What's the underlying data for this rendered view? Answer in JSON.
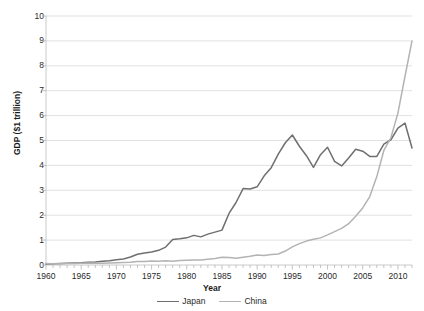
{
  "chart_data": {
    "type": "line",
    "title": "",
    "xlabel": "Year",
    "ylabel": "GDP ($1 trillion)",
    "xlim": [
      1960,
      2012
    ],
    "ylim": [
      0,
      10
    ],
    "ytick_labels": [
      "0",
      "1",
      "2",
      "3",
      "4",
      "5",
      "6",
      "7",
      "8",
      "9",
      "10"
    ],
    "ytick_values": [
      0,
      1,
      2,
      3,
      4,
      5,
      6,
      7,
      8,
      9,
      10
    ],
    "xtick_labels": [
      "1960",
      "1965",
      "1970",
      "1975",
      "1980",
      "1985",
      "1990",
      "1995",
      "2000",
      "2005",
      "2010"
    ],
    "xtick_values": [
      1960,
      1965,
      1970,
      1975,
      1980,
      1985,
      1990,
      1995,
      2000,
      2005,
      2010
    ],
    "minor_xticks_every": 1,
    "grid": "horizontal",
    "legend_position": "bottom",
    "x": [
      1960,
      1961,
      1962,
      1963,
      1964,
      1965,
      1966,
      1967,
      1968,
      1969,
      1970,
      1971,
      1972,
      1973,
      1974,
      1975,
      1976,
      1977,
      1978,
      1979,
      1980,
      1981,
      1982,
      1983,
      1984,
      1985,
      1986,
      1987,
      1988,
      1989,
      1990,
      1991,
      1992,
      1993,
      1994,
      1995,
      1996,
      1997,
      1998,
      1999,
      2000,
      2001,
      2002,
      2003,
      2004,
      2005,
      2006,
      2007,
      2008,
      2009,
      2010,
      2011,
      2012
    ],
    "series": [
      {
        "name": "Japan",
        "color": "#6f6f6f",
        "values": [
          0.04,
          0.05,
          0.06,
          0.07,
          0.08,
          0.09,
          0.11,
          0.12,
          0.15,
          0.17,
          0.21,
          0.24,
          0.32,
          0.43,
          0.48,
          0.52,
          0.59,
          0.72,
          1.02,
          1.05,
          1.09,
          1.19,
          1.13,
          1.24,
          1.32,
          1.4,
          2.07,
          2.51,
          3.07,
          3.05,
          3.14,
          3.58,
          3.91,
          4.45,
          4.91,
          5.22,
          4.77,
          4.39,
          3.92,
          4.43,
          4.73,
          4.16,
          3.98,
          4.3,
          4.65,
          4.57,
          4.36,
          4.36,
          4.85,
          5.03,
          5.5,
          5.7,
          4.7
        ]
      },
      {
        "name": "China",
        "color": "#b3b3b3",
        "values": [
          0.06,
          0.05,
          0.05,
          0.06,
          0.06,
          0.07,
          0.08,
          0.07,
          0.07,
          0.08,
          0.09,
          0.1,
          0.11,
          0.14,
          0.14,
          0.16,
          0.15,
          0.17,
          0.15,
          0.18,
          0.19,
          0.2,
          0.2,
          0.23,
          0.26,
          0.31,
          0.3,
          0.27,
          0.31,
          0.35,
          0.4,
          0.38,
          0.42,
          0.44,
          0.56,
          0.73,
          0.86,
          0.96,
          1.03,
          1.09,
          1.21,
          1.34,
          1.47,
          1.66,
          1.96,
          2.29,
          2.75,
          3.55,
          4.6,
          5.11,
          6.1,
          7.57,
          9.0
        ]
      }
    ]
  }
}
